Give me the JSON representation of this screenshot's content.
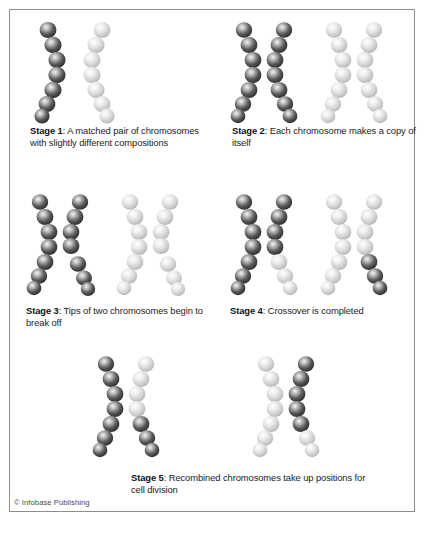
{
  "figure": {
    "copyright": "© Infobase Publishing",
    "border_color": "#8d8d8d",
    "background_color": "#ffffff",
    "text_color": "#1c1c1c"
  },
  "palette": {
    "dark_chromatid": "#3a3a3a",
    "dark_chromatid_highlight": "#f2f2f2",
    "light_chromatid": "#d2d2d2",
    "light_chromatid_highlight": "#ffffff",
    "outline": "#6e6e6e"
  },
  "stages": [
    {
      "id": "stage-1",
      "label": "Stage 1",
      "separator": ": ",
      "text": "A matched pair of chromosomes with slightly different compositions",
      "caption_full": "Stage 1: A matched pair of chromosomes with slightly different compositions",
      "art_name": "stage-1-chromosome-art",
      "art_description": "One dark single chromatid on the left and one light single chromatid on the right, curving away from each other"
    },
    {
      "id": "stage-2",
      "label": "Stage 2",
      "separator": ": ",
      "text": "Each chromosome makes a copy of itself",
      "caption_full": "Stage 2: Each chromosome makes a copy of itself",
      "art_name": "stage-2-chromosome-art",
      "art_description": "A duplicated dark chromosome (two sister chromatids forming an X) beside a duplicated light chromosome"
    },
    {
      "id": "stage-3",
      "label": "Stage 3",
      "separator": ": ",
      "text": "Tips of two chromosomes begin to break off",
      "caption_full": "Stage 3: Tips of two chromosomes begin to break off",
      "art_name": "stage-3-chromosome-art",
      "art_description": "Dark and light duplicated chromosomes each showing a break notch on the lower inner chromatid arm"
    },
    {
      "id": "stage-4",
      "label": "Stage 4",
      "separator": ": ",
      "text": "Crossover is completed",
      "caption_full": "Stage 4: Crossover is completed",
      "art_name": "stage-4-chromosome-art",
      "art_description": "Dark chromosome now carries a light lower tip and light chromosome now carries a dark lower segment"
    },
    {
      "id": "stage-5",
      "label": "Stage 5",
      "separator": ": ",
      "text": "Recombined chromosomes take up positions for cell division",
      "caption_full": "Stage 5: Recombined chromosomes take up positions for cell division",
      "art_name": "stage-5-chromosome-art",
      "art_description": "Two recombined chromosomes separated, each a mix of dark and light segments"
    }
  ]
}
